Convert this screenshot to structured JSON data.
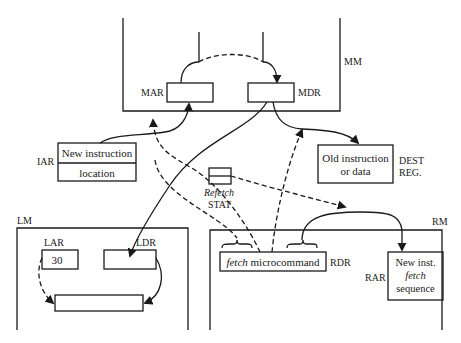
{
  "modules": {
    "mm": {
      "label": "MM"
    },
    "lm": {
      "label": "LM"
    },
    "rm": {
      "label": "RM"
    }
  },
  "registers": {
    "mar": {
      "label": "MAR"
    },
    "mdr": {
      "label": "MDR"
    },
    "iar": {
      "label": "IAR",
      "line1": "New instruction",
      "line2": "location"
    },
    "dest": {
      "label1": "DEST",
      "label2": "REG.",
      "line1": "Old instruction",
      "line2": "or data"
    },
    "stat": {
      "label1": "Refetch",
      "label2": "STAT"
    },
    "lar": {
      "label": "LAR",
      "value": "30"
    },
    "ldr": {
      "label": "LDR"
    },
    "rdr": {
      "label": "RDR",
      "text_italic": "fetch",
      "text_rest": " microcommand"
    },
    "rar": {
      "label": "RAR",
      "line1": "New inst.",
      "line2": "fetch",
      "line3": "sequence"
    }
  },
  "colors": {
    "ink": "#1a1a1a",
    "background": "#ffffff"
  }
}
